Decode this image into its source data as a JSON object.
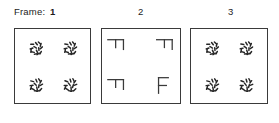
{
  "figure": {
    "frame_row": {
      "frame_word": "Frame:",
      "numbers": [
        "1",
        "2",
        "3"
      ]
    },
    "duration_row": {
      "dur_word": "Dur:",
      "values": [
        "400",
        "T",
        "400"
      ]
    },
    "panels": [
      {
        "id": "frame-1",
        "content_type": "dot-clusters",
        "clusters": [
          {
            "position": "top-left",
            "cx": 22,
            "cy": 20
          },
          {
            "position": "top-right",
            "cx": 57,
            "cy": 20
          },
          {
            "position": "bottom-left",
            "cx": 22,
            "cy": 58
          },
          {
            "position": "bottom-right",
            "cx": 57,
            "cy": 58
          }
        ],
        "dot_offsets": [
          [
            -7,
            -7
          ],
          [
            0,
            -8
          ],
          [
            7,
            -6
          ],
          [
            -8,
            0
          ],
          [
            -2,
            -2
          ],
          [
            4,
            1
          ],
          [
            8,
            -1
          ],
          [
            -6,
            6
          ],
          [
            1,
            5
          ],
          [
            7,
            7
          ],
          [
            -1,
            9
          ],
          [
            5,
            -9
          ],
          [
            -9,
            4
          ],
          [
            3,
            9
          ]
        ],
        "dot_color": "#262626"
      },
      {
        "id": "frame-2",
        "content_type": "letter-shapes",
        "shapes": [
          {
            "position": "top-left",
            "glyph": "rotated-F",
            "rotation": 90
          },
          {
            "position": "top-right",
            "glyph": "rotated-F",
            "rotation": 90
          },
          {
            "position": "bottom-left",
            "glyph": "rotated-F",
            "rotation": 90
          },
          {
            "position": "bottom-right",
            "glyph": "F",
            "rotation": 0
          }
        ],
        "stroke_color": "#3a3a3a"
      },
      {
        "id": "frame-3",
        "content_type": "dot-clusters",
        "clusters": [
          {
            "position": "top-left",
            "cx": 22,
            "cy": 20
          },
          {
            "position": "top-right",
            "cx": 57,
            "cy": 20
          },
          {
            "position": "bottom-left",
            "cx": 22,
            "cy": 58
          },
          {
            "position": "bottom-right",
            "cx": 57,
            "cy": 58
          }
        ],
        "dot_offsets": [
          [
            -7,
            -7
          ],
          [
            0,
            -8
          ],
          [
            7,
            -6
          ],
          [
            -8,
            0
          ],
          [
            -2,
            -2
          ],
          [
            4,
            1
          ],
          [
            8,
            -1
          ],
          [
            -6,
            6
          ],
          [
            1,
            5
          ],
          [
            7,
            7
          ],
          [
            -1,
            9
          ],
          [
            5,
            -9
          ],
          [
            -9,
            4
          ],
          [
            3,
            9
          ]
        ],
        "dot_color": "#262626"
      }
    ],
    "colors": {
      "panel_border": "#3a3a3a",
      "text": "#1c1c1c",
      "background": "#ffffff"
    }
  }
}
